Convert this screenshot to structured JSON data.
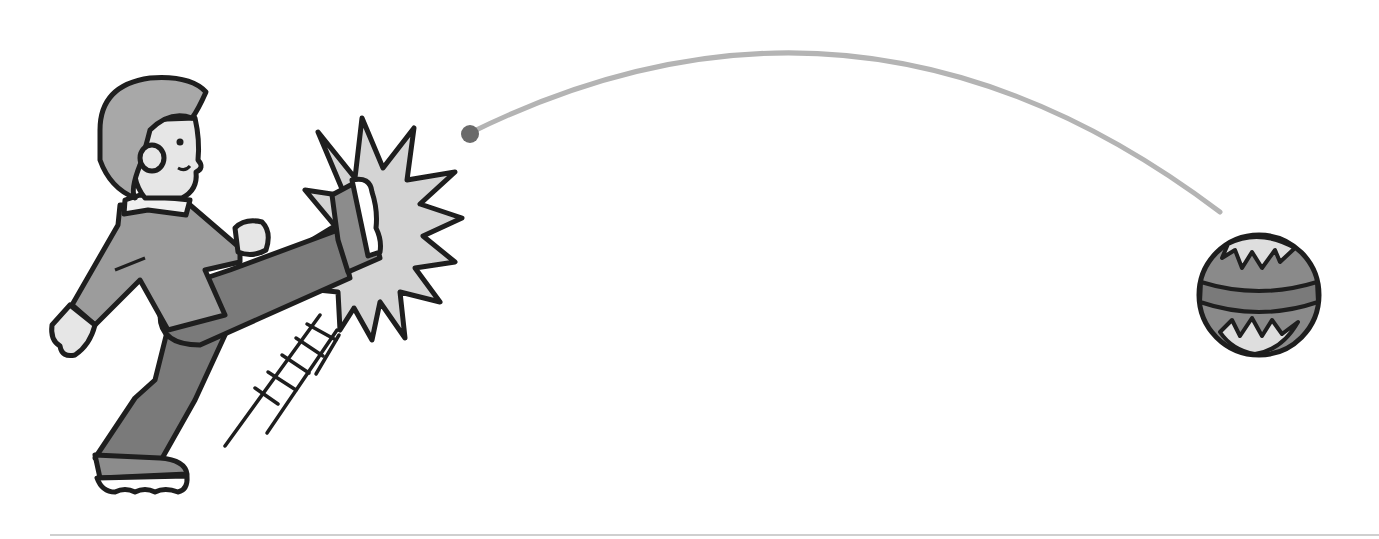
{
  "illustration": {
    "description": "Boy kicking a ball; ball flies along an arc to the right",
    "colors": {
      "background": "#ffffff",
      "outline": "#1e1e1e",
      "hair": "#a8a8a8",
      "skin": "#e6e6e6",
      "jacket": "#9c9c9c",
      "pants": "#7a7a7a",
      "collar": "#f0f0f0",
      "burst": "#d4d4d4",
      "shoe": "#8c8c8c",
      "sole": "#ffffff",
      "trajectory": "#b4b4b4",
      "trajectory_start_dot": "#6a6a6a",
      "ball_main": "#8a8a8a",
      "ball_band": "#7a7a7a",
      "ball_light": "#dedede",
      "ground_line": "#d0d0d0"
    },
    "elements": [
      "boy",
      "impact-burst",
      "motion-lines",
      "trajectory-arc",
      "ball",
      "ground-line"
    ]
  }
}
